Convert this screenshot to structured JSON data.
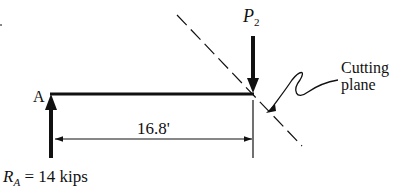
{
  "diagram": {
    "type": "free-body beam section",
    "beam": {
      "left_end_label": "A",
      "span_dimension": "16.8'"
    },
    "loads": {
      "point_load_label": "P",
      "point_load_subscript": "2",
      "reaction_label": "R",
      "reaction_subscript": "A",
      "reaction_equals": " = ",
      "reaction_value": "14 kips"
    },
    "annotations": {
      "cutting_plane_line1": "Cutting",
      "cutting_plane_line2": "plane"
    },
    "colors": {
      "ink": "#111111",
      "background": "#ffffff"
    }
  }
}
